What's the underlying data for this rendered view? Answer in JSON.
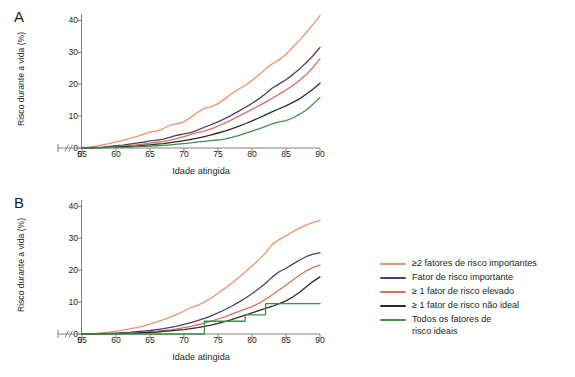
{
  "figure": {
    "panels": [
      {
        "id": "A",
        "label": "A",
        "xlabel": "Idade atingida",
        "ylabel": "Risco durante a vida (%)"
      },
      {
        "id": "B",
        "label": "B",
        "xlabel": "Idade atingida",
        "ylabel": "Risco durante a vida (%)"
      }
    ],
    "axis_break_symbol": "//",
    "origin_tick": "0"
  },
  "legend": {
    "position": "right",
    "entries": [
      {
        "label": "≥2 fatores de risco importantes",
        "color": "#e8956b"
      },
      {
        "label": "Fator de risco importante",
        "color": "#4b3f72"
      },
      {
        "label": "≥ 1 fator de risco elevado",
        "color": "#d9705c"
      },
      {
        "label": "≥ 1 fator de risco não ideal",
        "color": "#2b2b2b"
      },
      {
        "label": "Todos os fatores de\nrisco ideais",
        "color": "#3f8f4f"
      }
    ]
  },
  "chart_data": [
    {
      "type": "line",
      "panel": "A",
      "title": "A",
      "xlabel": "Idade atingida",
      "ylabel": "Risco durante a vida (%)",
      "xlim": [
        55,
        90
      ],
      "ylim": [
        0,
        42
      ],
      "xticks": [
        0,
        55,
        60,
        65,
        70,
        75,
        80,
        85,
        90
      ],
      "yticks": [
        0,
        10,
        20,
        30,
        40
      ],
      "axis_break": true,
      "grid": false,
      "legend_position": "right",
      "x": [
        55,
        56,
        57,
        58,
        59,
        60,
        61,
        62,
        63,
        64,
        65,
        66,
        67,
        68,
        69,
        70,
        71,
        72,
        73,
        74,
        75,
        76,
        77,
        78,
        79,
        80,
        81,
        82,
        83,
        84,
        85,
        86,
        87,
        88,
        89,
        90
      ],
      "series": [
        {
          "name": "≥2 fatores de risco importantes",
          "color": "#e8956b",
          "values": [
            0.1,
            0.3,
            0.6,
            1.0,
            1.4,
            1.9,
            2.4,
            3.0,
            3.6,
            4.3,
            5.0,
            5.3,
            6.1,
            7.2,
            7.6,
            8.2,
            9.6,
            11.2,
            12.4,
            12.9,
            13.9,
            15.4,
            17.0,
            18.4,
            19.6,
            21.2,
            22.9,
            24.8,
            26.4,
            27.6,
            29.4,
            31.6,
            33.8,
            36.2,
            38.8,
            41.5
          ]
        },
        {
          "name": "Fator de risco importante",
          "color": "#4b3f72",
          "values": [
            0.0,
            0.1,
            0.2,
            0.3,
            0.5,
            0.7,
            0.9,
            1.2,
            1.5,
            1.8,
            2.2,
            2.5,
            2.8,
            3.4,
            4.0,
            4.4,
            4.8,
            5.6,
            6.5,
            7.3,
            8.2,
            9.2,
            10.3,
            11.5,
            12.7,
            14.0,
            15.4,
            17.0,
            18.8,
            20.1,
            21.4,
            23.0,
            24.8,
            26.8,
            29.0,
            31.5
          ]
        },
        {
          "name": "≥ 1 fator de risco elevado",
          "color": "#d9705c",
          "values": [
            0.0,
            0.1,
            0.1,
            0.2,
            0.3,
            0.4,
            0.6,
            0.8,
            1.0,
            1.2,
            1.5,
            1.8,
            2.1,
            2.5,
            3.0,
            3.6,
            4.3,
            4.8,
            5.3,
            6.0,
            6.9,
            7.8,
            8.8,
            9.9,
            11.0,
            12.1,
            13.2,
            14.4,
            15.6,
            16.9,
            18.2,
            19.6,
            21.2,
            23.0,
            25.3,
            28.0
          ]
        },
        {
          "name": "≥ 1 fator de risco não ideal",
          "color": "#2b2b2b",
          "values": [
            0.0,
            0.0,
            0.1,
            0.1,
            0.2,
            0.3,
            0.4,
            0.5,
            0.6,
            0.8,
            1.0,
            1.2,
            1.4,
            1.7,
            2.0,
            2.3,
            2.7,
            3.1,
            3.6,
            4.1,
            4.7,
            5.3,
            6.0,
            6.8,
            7.6,
            8.5,
            9.4,
            10.4,
            11.4,
            12.3,
            13.2,
            14.3,
            15.4,
            16.9,
            18.5,
            20.3
          ]
        },
        {
          "name": "Todos os fatores de risco ideais",
          "color": "#3f8f4f",
          "values": [
            0.0,
            0.0,
            0.0,
            0.1,
            0.1,
            0.2,
            0.2,
            0.3,
            0.4,
            0.5,
            0.6,
            0.7,
            0.8,
            1.0,
            1.2,
            1.4,
            1.6,
            1.9,
            2.1,
            2.3,
            2.5,
            2.8,
            3.3,
            3.9,
            4.6,
            5.3,
            6.0,
            6.8,
            7.6,
            8.2,
            8.6,
            9.4,
            10.6,
            11.9,
            13.8,
            15.8
          ]
        }
      ]
    },
    {
      "type": "line",
      "panel": "B",
      "title": "B",
      "xlabel": "Idade atingida",
      "ylabel": "Risco durante a vida (%)",
      "xlim": [
        55,
        90
      ],
      "ylim": [
        0,
        42
      ],
      "xticks": [
        0,
        55,
        60,
        65,
        70,
        75,
        80,
        85,
        90
      ],
      "yticks": [
        0,
        10,
        20,
        30,
        40
      ],
      "axis_break": true,
      "grid": false,
      "legend_position": "right",
      "x": [
        55,
        56,
        57,
        58,
        59,
        60,
        61,
        62,
        63,
        64,
        65,
        66,
        67,
        68,
        69,
        70,
        71,
        72,
        73,
        74,
        75,
        76,
        77,
        78,
        79,
        80,
        81,
        82,
        83,
        84,
        85,
        86,
        87,
        88,
        89,
        90
      ],
      "series": [
        {
          "name": "≥2 fatores de risco importantes",
          "color": "#e8956b",
          "values": [
            0.0,
            0.1,
            0.2,
            0.4,
            0.6,
            0.9,
            1.2,
            1.6,
            2.0,
            2.5,
            3.1,
            3.8,
            4.5,
            5.3,
            6.2,
            7.2,
            8.3,
            9.0,
            10.0,
            11.3,
            12.8,
            14.3,
            15.9,
            17.6,
            19.4,
            21.3,
            23.3,
            25.4,
            28.1,
            29.6,
            30.8,
            32.0,
            33.2,
            34.2,
            35.0,
            35.5
          ]
        },
        {
          "name": "Fator de risco importante",
          "color": "#4b3f72",
          "values": [
            0.0,
            0.0,
            0.1,
            0.1,
            0.2,
            0.3,
            0.4,
            0.5,
            0.7,
            0.9,
            1.1,
            1.4,
            1.7,
            2.1,
            2.5,
            3.0,
            3.6,
            4.2,
            4.9,
            5.7,
            6.6,
            7.6,
            8.7,
            9.9,
            11.2,
            12.6,
            14.2,
            15.9,
            17.9,
            19.5,
            20.6,
            21.9,
            23.2,
            24.3,
            25.0,
            25.5
          ]
        },
        {
          "name": "≥ 1 fator de risco elevado",
          "color": "#d9705c",
          "values": [
            0.0,
            0.0,
            0.0,
            0.1,
            0.1,
            0.2,
            0.2,
            0.3,
            0.4,
            0.5,
            0.7,
            0.9,
            1.1,
            1.3,
            1.6,
            2.0,
            2.4,
            2.9,
            3.4,
            4.0,
            4.7,
            5.4,
            6.2,
            7.0,
            7.8,
            8.6,
            9.6,
            10.9,
            12.3,
            13.8,
            15.3,
            16.9,
            18.4,
            19.8,
            20.9,
            21.6
          ]
        },
        {
          "name": "≥ 1 fator de risco não ideal",
          "color": "#2b2b2b",
          "values": [
            0.0,
            0.0,
            0.0,
            0.0,
            0.1,
            0.1,
            0.2,
            0.2,
            0.3,
            0.4,
            0.5,
            0.6,
            0.8,
            1.0,
            1.2,
            1.4,
            1.7,
            2.0,
            2.4,
            2.8,
            3.3,
            3.9,
            4.5,
            5.2,
            5.9,
            6.6,
            7.3,
            8.0,
            8.7,
            9.5,
            10.4,
            11.6,
            13.1,
            14.8,
            16.5,
            17.9
          ]
        },
        {
          "name": "Todos os fatores de risco ideais",
          "color": "#3f8f4f",
          "values": [
            0.0,
            0.0,
            0.0,
            0.0,
            0.0,
            0.0,
            0.0,
            0.0,
            0.0,
            0.0,
            0.0,
            0.0,
            0.0,
            0.0,
            0.0,
            0.0,
            0.0,
            0.0,
            4.0,
            4.0,
            4.0,
            4.0,
            4.0,
            4.0,
            6.0,
            6.0,
            6.0,
            9.5,
            9.5,
            9.5,
            9.5,
            9.5,
            9.5,
            9.5,
            9.5,
            9.5
          ]
        }
      ]
    }
  ]
}
